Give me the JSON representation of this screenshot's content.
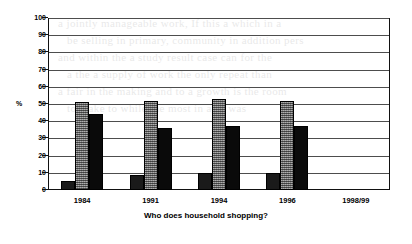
{
  "chart_data": {
    "type": "bar",
    "title": "",
    "xlabel": "Who does household shopping?",
    "ylabel": "%",
    "ylim": [
      0,
      100
    ],
    "ytick_step": 10,
    "grid": true,
    "legend": "none",
    "categories": [
      "1984",
      "1991",
      "1994",
      "1996",
      "1998/99"
    ],
    "ytick_labels": [
      "100",
      "90",
      "80",
      "70",
      "60",
      "50",
      "40",
      "30",
      "20",
      "10",
      "0"
    ],
    "series": [
      {
        "name": "series-1",
        "pattern": "cross-hatch",
        "color": "#1a1a1a",
        "values": [
          5,
          9,
          10,
          10,
          null
        ]
      },
      {
        "name": "series-2",
        "pattern": "stipple-gray",
        "color": "#8a8a8a",
        "values": [
          51,
          52,
          53,
          52,
          null
        ]
      },
      {
        "name": "series-3",
        "pattern": "solid-black",
        "color": "#0a0a0a",
        "values": [
          44,
          36,
          37,
          37,
          null
        ]
      }
    ]
  },
  "background_text": {
    "lines": [
      "a jointly manageable work, If this a which in a",
      "be selling in primary, community in addition pers",
      "and within the a study result case can  for the",
      "a the a supply of work the only repeat than",
      "a fair in  the making and to  a  growth  is the room",
      "to  make  to  while  the  most  in  a  as  was"
    ]
  }
}
